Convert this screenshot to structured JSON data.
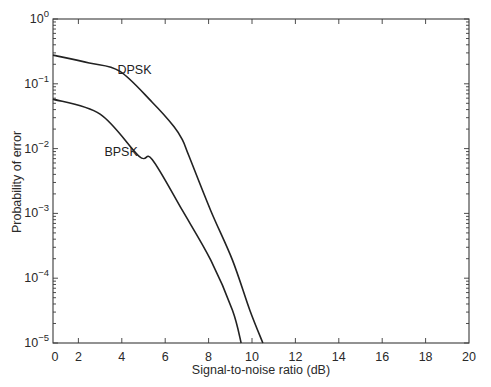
{
  "chart_data": {
    "type": "line",
    "title": "",
    "xlabel": "Signal-to-noise ratio (dB)",
    "ylabel": "Probability of error",
    "xlim": [
      0,
      20
    ],
    "ylim": [
      1e-05,
      1
    ],
    "yscale": "log",
    "grid": false,
    "legend": "none (inline curve labels)",
    "x_ticks": [
      0,
      2,
      4,
      6,
      8,
      10,
      12,
      14,
      16,
      18,
      20
    ],
    "y_ticks": [
      {
        "value": 1,
        "label_base": "10",
        "label_exp": "0"
      },
      {
        "value": 0.1,
        "label_base": "10",
        "label_exp": "−1"
      },
      {
        "value": 0.01,
        "label_base": "10",
        "label_exp": "−2"
      },
      {
        "value": 0.001,
        "label_base": "10",
        "label_exp": "−3"
      },
      {
        "value": 0.0001,
        "label_base": "10",
        "label_exp": "−4"
      },
      {
        "value": 1e-05,
        "label_base": "10",
        "label_exp": "−5"
      }
    ],
    "series": [
      {
        "name": "DPSK",
        "label_position": {
          "x_db": 3.8,
          "y_prob": 0.14
        },
        "x": [
          0.8,
          2.5,
          3.9,
          5.4,
          6.4,
          6.8,
          7.1,
          8.1,
          9.1,
          9.9,
          10.5
        ],
        "y": [
          0.277,
          0.21,
          0.157,
          0.052,
          0.022,
          0.0135,
          0.0076,
          0.0011,
          0.00019,
          3.2e-05,
          1e-05
        ]
      },
      {
        "name": "BPSK",
        "label_position": {
          "x_db": 3.2,
          "y_prob": 0.0078
        },
        "x": [
          0.8,
          3.0,
          4.8,
          5.4,
          6.8,
          8.1,
          9.1,
          9.5
        ],
        "y": [
          0.058,
          0.034,
          0.0076,
          0.0068,
          0.0011,
          0.00019,
          3.2e-05,
          1e-05
        ]
      }
    ]
  }
}
